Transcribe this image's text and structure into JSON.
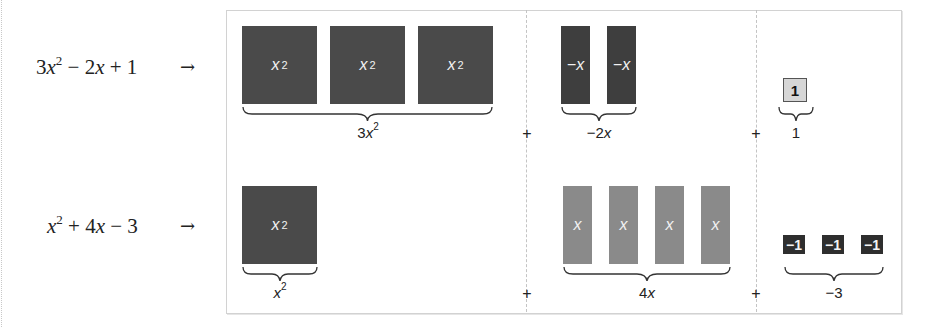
{
  "rows": [
    {
      "expression": {
        "a": "3",
        "v1": "x",
        "e1": "2",
        "op1": " − 2",
        "v2": "x",
        "op2": " + 1"
      },
      "arrow": "→",
      "groups": [
        {
          "tiles": [
            {
              "label": "x",
              "sup": "2"
            },
            {
              "label": "x",
              "sup": "2"
            },
            {
              "label": "x",
              "sup": "2"
            }
          ],
          "brace_label": {
            "coef": "3",
            "var": "x",
            "sup": "2"
          }
        },
        {
          "tiles": [
            {
              "label": "−x"
            },
            {
              "label": "−x"
            }
          ],
          "brace_label": {
            "coef": "−2",
            "var": "x",
            "sup": ""
          }
        },
        {
          "tiles": [
            {
              "label": "1"
            }
          ],
          "brace_label": {
            "coef": "1",
            "var": "",
            "sup": ""
          }
        }
      ],
      "plus_signs": [
        "+",
        "+"
      ]
    },
    {
      "expression": {
        "a": "",
        "v1": "x",
        "e1": "2",
        "op1": " + 4",
        "v2": "x",
        "op2": " − 3"
      },
      "arrow": "→",
      "groups": [
        {
          "tiles": [
            {
              "label": "x",
              "sup": "2"
            }
          ],
          "brace_label": {
            "coef": "",
            "var": "x",
            "sup": "2"
          }
        },
        {
          "tiles": [
            {
              "label": "x"
            },
            {
              "label": "x"
            },
            {
              "label": "x"
            },
            {
              "label": "x"
            }
          ],
          "brace_label": {
            "coef": "4",
            "var": "x",
            "sup": ""
          }
        },
        {
          "tiles": [
            {
              "label": "−1"
            },
            {
              "label": "−1"
            },
            {
              "label": "−1"
            }
          ],
          "brace_label": {
            "coef": "−3",
            "var": "",
            "sup": ""
          }
        }
      ],
      "plus_signs": [
        "+",
        "+"
      ]
    }
  ],
  "colors": {
    "x2_tile": "#4a4a4a",
    "neg_x_tile": "#3e3e3e",
    "pos_x_tile": "#8a8a8a",
    "one_tile": "#d6d6d6",
    "neg_one_tile": "#2e2e2e",
    "frame_border": "#d2d2d2",
    "divider": "#c4c4c4"
  }
}
